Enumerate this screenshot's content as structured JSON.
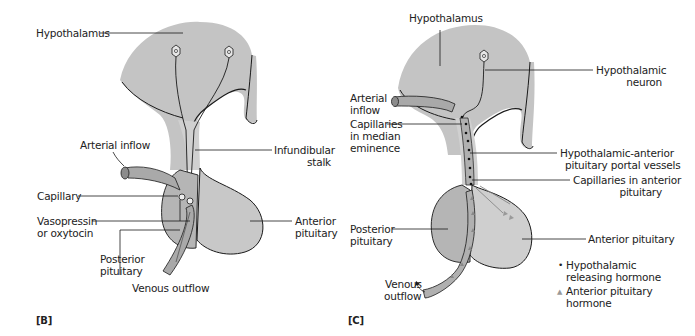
{
  "panels": [
    {
      "id": "B",
      "tag": "[B]",
      "labels": {
        "hypothalamus": "Hypothalamus",
        "arterial_inflow": "Arterial inflow",
        "infundibular_stalk_1": "Infundibular",
        "infundibular_stalk_2": "stalk",
        "capillary": "Capillary",
        "vasopressin_1": "Vasopressin",
        "vasopressin_2": "or oxytocin",
        "posterior_1": "Posterior",
        "posterior_2": "pituitary",
        "anterior_1": "Anterior",
        "anterior_2": "pituitary",
        "venous_outflow": "Venous outflow"
      }
    },
    {
      "id": "C",
      "tag": "[C]",
      "labels": {
        "hypothalamus": "Hypothalamus",
        "neuron_1": "Hypothalamic",
        "neuron_2": "neuron",
        "arterial_1": "Arterial",
        "arterial_2": "inflow",
        "cap_median_1": "Capillaries",
        "cap_median_2": "in median",
        "cap_median_3": "eminence",
        "portal_1": "Hypothalamic-anterior",
        "portal_2": "pituitary portal vessels",
        "cap_anterior_1": "Capillaries in anterior",
        "cap_anterior_2": "pituitary",
        "posterior_1": "Posterior",
        "posterior_2": "pituitary",
        "anterior": "Anterior pituitary",
        "venous_1": "Venous",
        "venous_2": "outflow"
      },
      "legend": [
        {
          "symbol": "•",
          "line1": "Hypothalamic",
          "line2": "releasing hormone"
        },
        {
          "symbol": "▲",
          "line1": "Anterior pituitary",
          "line2": "hormone"
        }
      ]
    }
  ],
  "colors": {
    "tissue": "#c4c4c4",
    "tissue_light": "#d3d3d3",
    "vessel": "#a9a9a9",
    "outline": "#1a1a1a",
    "text": "#222222"
  }
}
